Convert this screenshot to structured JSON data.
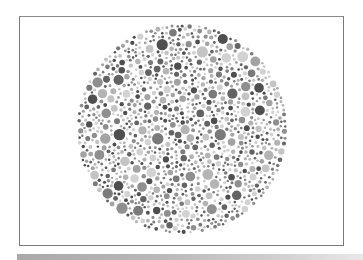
{
  "figure": {
    "type": "ishihara-color-vision-test-plate",
    "rendering": "grayscale",
    "frame": {
      "x": 19,
      "y": 16,
      "width": 325,
      "height": 230,
      "border_color": "#7a7a7a"
    },
    "circle": {
      "cx": 182,
      "cy": 129,
      "r": 105
    },
    "dot_palette": [
      "#4f4f4f",
      "#636363",
      "#7a7a7a",
      "#8f8f8f",
      "#a3a3a3",
      "#b4b4b4",
      "#c4c4c4",
      "#d2d2d2"
    ],
    "dot_radius_range": [
      1.2,
      5.8
    ],
    "background": "#ffffff",
    "bottom_bar_color": "#a9a9a9"
  }
}
